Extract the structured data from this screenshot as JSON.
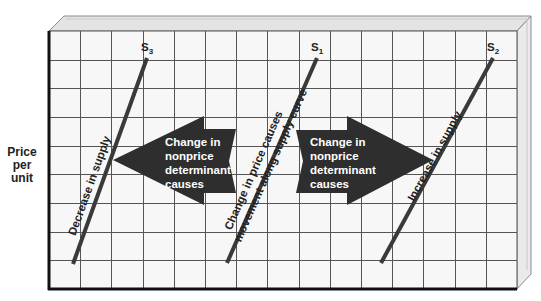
{
  "colors": {
    "background": "#ffffff",
    "grid_fill": "#f7f7f7",
    "grid_line": "#555555",
    "axis": "#111111",
    "box_top": "#e4e4e4",
    "box_side": "#eaeaea",
    "box_edge": "#8a8a8a",
    "curve": "#3a3a3a",
    "arrow_fill": "#2e2e2e",
    "arrow_text": "#ffffff",
    "label_text": "#222222"
  },
  "y_axis_label": {
    "line1": "Price",
    "line2": "per",
    "line3": "unit"
  },
  "grid": {
    "left": 49,
    "top": 31,
    "right": 517,
    "bottom": 289,
    "columns": 15,
    "rows": 9,
    "depth_x": 14,
    "depth_y": 15
  },
  "curves": [
    {
      "id": "S3",
      "name": "S",
      "subscript": "3",
      "x1": 147,
      "y1": 58,
      "x2": 73,
      "y2": 264,
      "label_x": 141,
      "label_y": 51,
      "annotation": "Decrease in supply"
    },
    {
      "id": "S1",
      "name": "S",
      "subscript": "1",
      "x1": 317,
      "y1": 58,
      "x2": 227,
      "y2": 263,
      "label_x": 311,
      "label_y": 51,
      "annotation_line1": "Change in price causes",
      "annotation_line2": "movement along supply curve"
    },
    {
      "id": "S2",
      "name": "S",
      "subscript": "2",
      "x1": 493,
      "y1": 58,
      "x2": 381,
      "y2": 263,
      "label_x": 487,
      "label_y": 51,
      "annotation": "Increase in supply"
    }
  ],
  "arrows": {
    "left": {
      "direction": "left",
      "lines": [
        "Change in",
        "nonprice",
        "determinant",
        "causes"
      ]
    },
    "right": {
      "direction": "right",
      "lines": [
        "Change in",
        "nonprice",
        "determinant",
        "causes"
      ]
    }
  },
  "chart_data": {
    "type": "line",
    "title": "",
    "xlabel": "",
    "ylabel": "Price per unit",
    "grid": true,
    "series": [
      {
        "name": "S3",
        "description": "Decrease in supply (shifted left)",
        "points": [
          [
            0.5,
            0.1
          ],
          [
            2.6,
            8.1
          ]
        ]
      },
      {
        "name": "S1",
        "description": "Original supply curve",
        "points": [
          [
            5.7,
            0.1
          ],
          [
            8.4,
            8.1
          ]
        ]
      },
      {
        "name": "S2",
        "description": "Increase in supply (shifted right)",
        "points": [
          [
            10.7,
            0.1
          ],
          [
            14.2,
            8.1
          ]
        ]
      }
    ],
    "annotations": [
      "Decrease in supply",
      "Change in price causes movement along supply curve",
      "Increase in supply",
      "Change in nonprice determinant causes (arrow pointing left toward S3)",
      "Change in nonprice determinant causes (arrow pointing right toward S2)"
    ]
  }
}
